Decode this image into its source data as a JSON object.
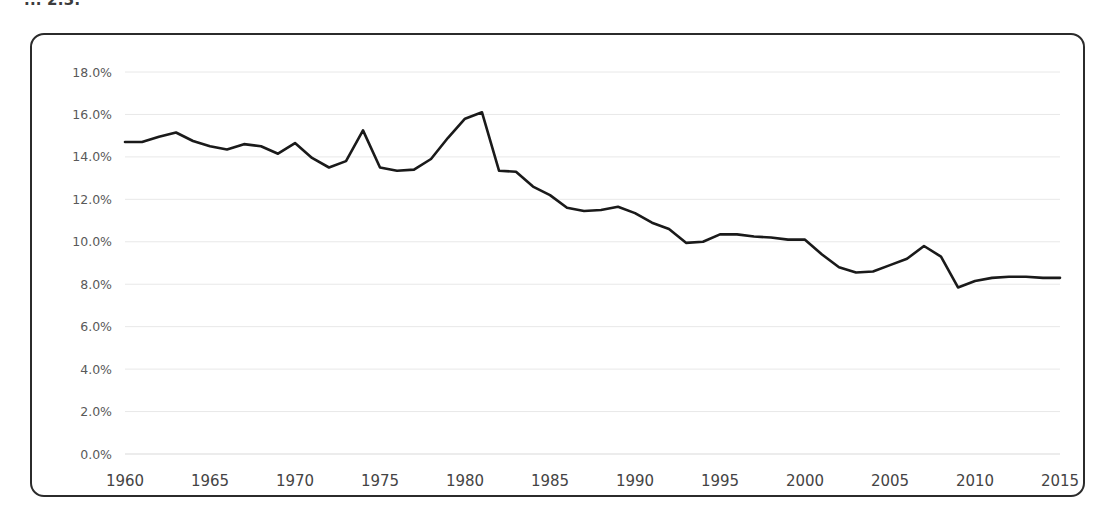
{
  "page": {
    "caption_clipped": "... 2.3:",
    "background_color": "#ffffff",
    "frame_border_color": "#2b2b2b"
  },
  "chart_data": {
    "type": "line",
    "title": "",
    "subtitle": "",
    "xlabel": "",
    "ylabel": "",
    "grid": true,
    "legend": null,
    "line_color": "#1a1a1a",
    "xlim": [
      1960,
      2015
    ],
    "ylim": [
      0,
      18
    ],
    "y_tick_labels": [
      "0.0%",
      "2.0%",
      "4.0%",
      "6.0%",
      "8.0%",
      "10.0%",
      "12.0%",
      "14.0%",
      "16.0%",
      "18.0%"
    ],
    "y_ticks": [
      0,
      2,
      4,
      6,
      8,
      10,
      12,
      14,
      16,
      18
    ],
    "x_tick_labels": [
      "1960",
      "1965",
      "1970",
      "1975",
      "1980",
      "1985",
      "1990",
      "1995",
      "2000",
      "2005",
      "2010",
      "2015"
    ],
    "x_ticks": [
      1960,
      1965,
      1970,
      1975,
      1980,
      1985,
      1990,
      1995,
      2000,
      2005,
      2010,
      2015
    ],
    "x": [
      1960,
      1961,
      1962,
      1963,
      1964,
      1965,
      1966,
      1967,
      1968,
      1969,
      1970,
      1971,
      1972,
      1973,
      1974,
      1975,
      1976,
      1977,
      1978,
      1979,
      1980,
      1981,
      1982,
      1983,
      1984,
      1985,
      1986,
      1987,
      1988,
      1989,
      1990,
      1991,
      1992,
      1993,
      1994,
      1995,
      1996,
      1997,
      1998,
      1999,
      2000,
      2001,
      2002,
      2003,
      2004,
      2005,
      2006,
      2007,
      2008,
      2009,
      2010,
      2011,
      2012,
      2013,
      2014,
      2015
    ],
    "values": [
      14.7,
      14.7,
      14.95,
      15.15,
      14.75,
      14.5,
      14.35,
      14.6,
      14.5,
      14.15,
      14.65,
      13.95,
      13.5,
      13.8,
      15.25,
      13.5,
      13.35,
      13.4,
      13.9,
      14.9,
      15.8,
      16.1,
      13.35,
      13.3,
      12.6,
      12.2,
      11.6,
      11.45,
      11.5,
      11.65,
      11.35,
      10.9,
      10.6,
      9.95,
      10.0,
      10.35,
      10.35,
      10.25,
      10.2,
      10.1,
      10.1,
      9.4,
      8.8,
      8.55,
      8.6,
      8.9,
      9.2,
      9.8,
      9.3,
      7.85,
      8.15,
      8.3,
      8.35,
      8.35,
      8.3,
      8.3
    ]
  }
}
